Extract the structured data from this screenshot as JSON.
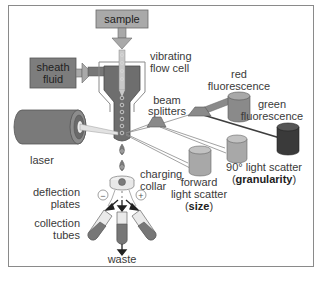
{
  "diagram": {
    "labels": {
      "sample": "sample",
      "sheath_line1": "sheath",
      "sheath_line2": "fluid",
      "vibrating_line1": "vibrating",
      "vibrating_line2": "flow cell",
      "laser": "laser",
      "beam_line1": "beam",
      "beam_line2": "splitters",
      "red_line1": "red",
      "red_line2": "fluorescence",
      "green_line1": "green",
      "green_line2": "fluorescence",
      "side_scatter_line1": "90° light scatter",
      "side_scatter_open": "(",
      "side_scatter_bold": "granularity",
      "side_scatter_close": ")",
      "forward_line1": "forward",
      "forward_line2": "light scatter",
      "forward_open": "(",
      "forward_bold": "size",
      "forward_close": ")",
      "charging_line1": "charging",
      "charging_line2": "collar",
      "deflection_line1": "deflection",
      "deflection_line2": "plates",
      "collection_line1": "collection",
      "collection_line2": "tubes",
      "waste": "waste",
      "minus": "−",
      "plus": "+"
    },
    "colors": {
      "dark_gray": "#6e6e6e",
      "mid_gray": "#9a9a9a",
      "light_gray": "#b5b5b5",
      "green_detector": "#3a3a3a",
      "frame": "#8a8a8a"
    }
  }
}
